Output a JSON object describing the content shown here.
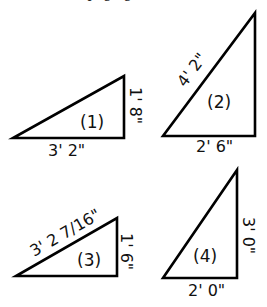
{
  "header_fragment": "the page gives the",
  "triangles": [
    {
      "id": "(1)",
      "base": "3' 2\"",
      "height": "1' 8\""
    },
    {
      "id": "(2)",
      "base": "2' 6\"",
      "hypotenuse": "4' 2\""
    },
    {
      "id": "(3)",
      "hypotenuse": "3' 2 7/16\"",
      "height": "1' 6\""
    },
    {
      "id": "(4)",
      "base": "2' 0\"",
      "height": "3' 0\""
    }
  ]
}
